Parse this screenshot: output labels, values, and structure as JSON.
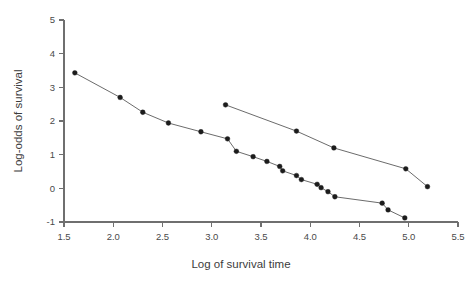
{
  "chart_data": {
    "type": "line",
    "title": "",
    "xlabel": "Log of survival time",
    "ylabel": "Log-odds of survival",
    "xlim": [
      1.5,
      5.5
    ],
    "ylim": [
      -1,
      5
    ],
    "xticks": [
      "1.5",
      "2.0",
      "2.5",
      "3.0",
      "3.5",
      "4.0",
      "4.5",
      "5.0",
      "5.5"
    ],
    "xtick_values": [
      1.5,
      2.0,
      2.5,
      3.0,
      3.5,
      4.0,
      4.5,
      5.0,
      5.5
    ],
    "yticks": [
      "-1",
      "0",
      "1",
      "2",
      "3",
      "4",
      "5"
    ],
    "ytick_values": [
      -1,
      0,
      1,
      2,
      3,
      4,
      5
    ],
    "grid": false,
    "legend": false,
    "legend_position": "none",
    "marker": "filled-circle",
    "line_color": "#5a5a5a",
    "marker_color": "#1c1c1c",
    "axis_color": "#6f6f6f",
    "background_color": "#ffffff",
    "series": [
      {
        "name": "series-1",
        "x": [
          1.61,
          2.07,
          2.3,
          2.56,
          2.89,
          3.16,
          3.25,
          3.42,
          3.56,
          3.69,
          3.72,
          3.86,
          3.91,
          4.07,
          4.11,
          4.18,
          4.25,
          4.73,
          4.79,
          4.96
        ],
        "y": [
          3.43,
          2.7,
          2.26,
          1.94,
          1.68,
          1.47,
          1.1,
          0.94,
          0.8,
          0.65,
          0.52,
          0.38,
          0.26,
          0.12,
          0.02,
          -0.1,
          -0.25,
          -0.44,
          -0.64,
          -0.88
        ]
      },
      {
        "name": "series-2",
        "x": [
          3.14,
          3.86,
          4.24,
          4.97,
          5.19
        ],
        "y": [
          2.48,
          1.7,
          1.2,
          0.58,
          0.05
        ]
      }
    ]
  }
}
